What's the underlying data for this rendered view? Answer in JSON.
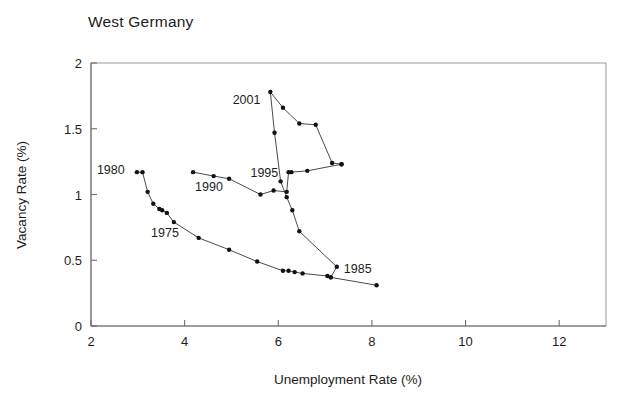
{
  "chart_data": {
    "type": "line",
    "title": "West Germany",
    "xlabel": "Unemployment Rate (%)",
    "ylabel": "Vacancy Rate (%)",
    "xlim": [
      2,
      13
    ],
    "ylim": [
      0,
      2
    ],
    "xticks": [
      2,
      4,
      6,
      8,
      10,
      12
    ],
    "xticklabels": [
      "2",
      "4",
      "6",
      "8",
      "10",
      "12"
    ],
    "yticks": [
      0,
      0.5,
      1,
      1.5,
      2
    ],
    "yticklabels": [
      "0",
      "0.5",
      "1",
      "1.5",
      "2"
    ],
    "grid": false,
    "legend": "none",
    "marker": "filled-circle",
    "line_color": "#4a4a4a",
    "marker_color": "#111111",
    "series": [
      {
        "name": "Beveridge curve (West Germany)",
        "x": [
          2.98,
          3.1,
          3.21,
          3.33,
          3.46,
          3.52,
          3.62,
          3.77,
          4.3,
          4.95,
          5.55,
          6.1,
          6.22,
          6.35,
          6.52,
          7.05,
          7.12,
          8.1
        ],
        "y": [
          1.17,
          1.17,
          1.02,
          0.93,
          0.89,
          0.88,
          0.86,
          0.79,
          0.67,
          0.58,
          0.49,
          0.42,
          0.42,
          0.41,
          0.4,
          0.38,
          0.37,
          0.31
        ]
      },
      {
        "name": "Recovery path (1985-2001)",
        "x": [
          7.12,
          7.25,
          6.45,
          6.3,
          6.18,
          6.05,
          5.92,
          5.83,
          6.1,
          6.45,
          6.8,
          7.15,
          7.35
        ],
        "y": [
          0.37,
          0.45,
          0.72,
          0.88,
          0.98,
          1.1,
          1.47,
          1.78,
          1.66,
          1.54,
          1.53,
          1.24,
          1.23
        ]
      },
      {
        "name": "Upper branch (1990-1995)",
        "x": [
          4.18,
          4.62,
          4.95,
          5.62,
          5.9,
          6.18,
          6.22,
          6.28,
          6.62,
          7.35
        ],
        "y": [
          1.17,
          1.14,
          1.12,
          1.0,
          1.03,
          1.02,
          1.17,
          1.17,
          1.18,
          1.23
        ]
      }
    ],
    "annotations": [
      {
        "label": "1980",
        "x": 2.72,
        "y": 1.19,
        "anchor": "end",
        "tick_x": 2.98,
        "tick_y": 1.17
      },
      {
        "label": "1975",
        "x": 3.58,
        "y": 0.71,
        "anchor": "middle"
      },
      {
        "label": "1990",
        "x": 4.52,
        "y": 1.06,
        "anchor": "middle"
      },
      {
        "label": "1995",
        "x": 6.0,
        "y": 1.17,
        "anchor": "end"
      },
      {
        "label": "2001",
        "x": 5.62,
        "y": 1.72,
        "anchor": "end"
      },
      {
        "label": "1985",
        "x": 7.4,
        "y": 0.44,
        "anchor": "start"
      }
    ]
  }
}
